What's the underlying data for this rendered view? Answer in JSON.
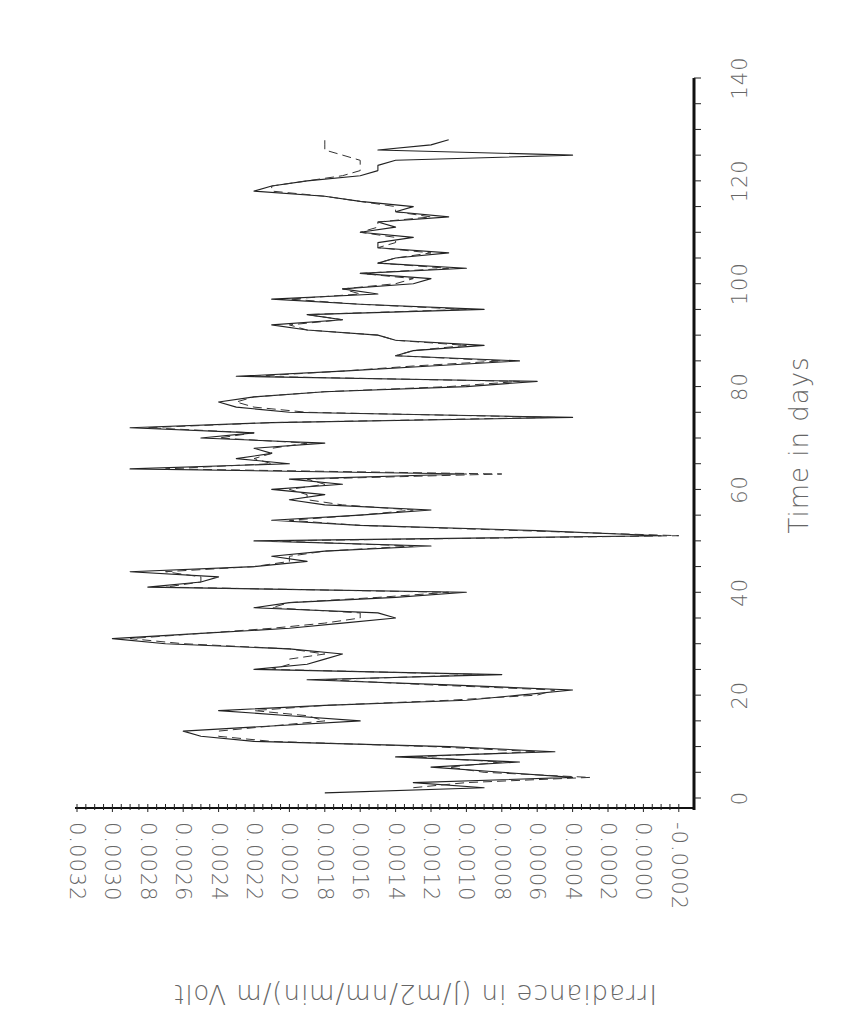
{
  "chart_data": {
    "type": "line",
    "orientation": "rotated-90-clockwise",
    "title": "",
    "xlabel": "Time in days",
    "ylabel": "Irradiance in (J/m2/nm/min)/m Volt",
    "xlim": [
      0,
      140
    ],
    "ylim": [
      -0.0002,
      0.0032
    ],
    "x_ticks": [
      "0",
      "20",
      "40",
      "60",
      "80",
      "100",
      "120",
      "140"
    ],
    "y_ticks": [
      "0.0032",
      "0.0030",
      "0.0028",
      "0.0026",
      "0.0024",
      "0.0022",
      "0.0020",
      "0.0018",
      "0.0016",
      "0.0014",
      "0.0012",
      "0.0010",
      "0.0008",
      "0.0006",
      "0.0004",
      "0.0002",
      "0.0000",
      "-0.0002"
    ],
    "grid": false,
    "legend": null,
    "series": [
      {
        "name": "measured (solid)",
        "style": "solid",
        "x": [
          1,
          2,
          3,
          4,
          5,
          6,
          7,
          8,
          9,
          10,
          11,
          12,
          13,
          14,
          15,
          16,
          17,
          18,
          19,
          20,
          21,
          22,
          23,
          24,
          25,
          26,
          27,
          28,
          29,
          30,
          31,
          32,
          33,
          34,
          35,
          36,
          37,
          38,
          39,
          40,
          41,
          42,
          43,
          44,
          45,
          46,
          47,
          48,
          49,
          50,
          51,
          52,
          53,
          54,
          55,
          56,
          57,
          58,
          59,
          60,
          61,
          62,
          63,
          64,
          65,
          66,
          67,
          68,
          69,
          70,
          71,
          72,
          73,
          74,
          75,
          76,
          77,
          78,
          79,
          80,
          81,
          82,
          83,
          84,
          85,
          86,
          87,
          88,
          89,
          90,
          91,
          92,
          93,
          94,
          95,
          96,
          97,
          98,
          99,
          100,
          101,
          102,
          103,
          104,
          105,
          106,
          107,
          108,
          109,
          110,
          111,
          112,
          113,
          114,
          115,
          116,
          117,
          118,
          119,
          120,
          121,
          122,
          123,
          124,
          125,
          126,
          127,
          128
        ],
        "values": [
          0.0018,
          0.0009,
          0.0013,
          0.0004,
          0.0008,
          0.0012,
          0.0007,
          0.0014,
          0.0005,
          0.0011,
          0.0022,
          0.0025,
          0.0026,
          0.0021,
          0.0016,
          0.002,
          0.0024,
          0.0018,
          0.001,
          0.0007,
          0.0004,
          0.0011,
          0.0019,
          0.0008,
          0.0022,
          0.0019,
          0.0018,
          0.0017,
          0.002,
          0.0027,
          0.003,
          0.0025,
          0.002,
          0.0017,
          0.0014,
          0.0015,
          0.0022,
          0.002,
          0.0014,
          0.001,
          0.0028,
          0.0025,
          0.0024,
          0.0029,
          0.0022,
          0.0019,
          0.0021,
          0.0018,
          0.0012,
          0.0022,
          -0.0001,
          0.0006,
          0.0016,
          0.0021,
          0.0016,
          0.0012,
          0.0018,
          0.002,
          0.0018,
          0.0021,
          0.0017,
          0.002,
          0.001,
          0.0029,
          0.002,
          0.0023,
          0.0021,
          0.0022,
          0.0018,
          0.0025,
          0.0022,
          0.0029,
          0.0021,
          0.0004,
          0.002,
          0.0023,
          0.0024,
          0.0022,
          0.0018,
          0.001,
          0.0006,
          0.0023,
          0.0017,
          0.0012,
          0.0007,
          0.0014,
          0.0013,
          0.0009,
          0.0014,
          0.0015,
          0.0019,
          0.0021,
          0.0017,
          0.0019,
          0.0009,
          0.0016,
          0.0021,
          0.0015,
          0.0017,
          0.0013,
          0.0012,
          0.0016,
          0.001,
          0.0015,
          0.0014,
          0.0011,
          0.0015,
          0.0015,
          0.0013,
          0.0016,
          0.0014,
          0.0015,
          0.0011,
          0.0014,
          0.0013,
          0.0016,
          0.0018,
          0.0022,
          0.0021,
          0.0019,
          0.0016,
          0.0015,
          0.0015,
          0.0014,
          0.0004,
          0.0015,
          0.0012,
          0.0011
        ]
      },
      {
        "name": "modelled (dashed)",
        "style": "dashed",
        "x": [
          2,
          3,
          4,
          5,
          6,
          7,
          8,
          9,
          10,
          11,
          12,
          13,
          14,
          15,
          16,
          17,
          18,
          19,
          20,
          21,
          22,
          23,
          24,
          25,
          26,
          27,
          28,
          29,
          30,
          31,
          32,
          33,
          34,
          35,
          36,
          37,
          38,
          39,
          40,
          41,
          42,
          43,
          44,
          45,
          46,
          47,
          48,
          49,
          50,
          51,
          52,
          53,
          54,
          55,
          56,
          57,
          58,
          59,
          60,
          61,
          62,
          63,
          64,
          65,
          66,
          67,
          68,
          69,
          70,
          71,
          72,
          73,
          74,
          75,
          76,
          77,
          78,
          79,
          80,
          81,
          82,
          83,
          84,
          85,
          86,
          87,
          88,
          89,
          90,
          91,
          92,
          93,
          94,
          95,
          96,
          97,
          98,
          99,
          100,
          101,
          102,
          103,
          104,
          105,
          106,
          107,
          108,
          109,
          110,
          111,
          112,
          113,
          114,
          115,
          116,
          117,
          118,
          119,
          120,
          121,
          122,
          123,
          124,
          125,
          126,
          127,
          128
        ],
        "values": [
          0.0013,
          0.001,
          0.0003,
          0.0009,
          0.0011,
          0.0008,
          0.0013,
          0.0006,
          0.0012,
          0.0021,
          0.0024,
          0.0024,
          0.0021,
          0.0018,
          0.0019,
          0.0022,
          0.0018,
          0.0011,
          0.0006,
          0.0005,
          0.0012,
          0.0018,
          0.0009,
          0.0021,
          0.002,
          0.002,
          0.0018,
          0.002,
          0.0026,
          0.0029,
          0.0025,
          0.0021,
          0.0018,
          0.0016,
          0.0016,
          0.0021,
          0.002,
          0.0015,
          0.0011,
          0.0027,
          0.0025,
          0.0025,
          0.0027,
          0.0022,
          0.002,
          0.002,
          0.0018,
          0.0013,
          0.0021,
          -0.0002,
          0.0007,
          0.0016,
          0.002,
          0.0016,
          0.0013,
          0.0017,
          0.0019,
          0.0019,
          0.002,
          0.0018,
          0.0019,
          0.0008,
          0.0027,
          0.0021,
          0.0022,
          0.0021,
          0.0021,
          0.0019,
          0.0024,
          0.0022,
          0.0028,
          0.0021,
          0.0005,
          0.0019,
          0.0022,
          0.0023,
          0.0022,
          0.0018,
          0.0011,
          0.0007,
          0.0022,
          0.0017,
          0.0013,
          0.0008,
          0.0014,
          0.0013,
          0.001,
          0.0014,
          0.0015,
          0.0019,
          0.002,
          0.0017,
          0.0019,
          0.001,
          0.0016,
          0.002,
          0.0016,
          0.0017,
          0.0014,
          0.0013,
          0.0016,
          0.0011,
          0.0015,
          0.0014,
          0.0012,
          0.0015,
          0.0014,
          0.0014,
          0.0016,
          0.0015,
          0.0015,
          0.0012,
          0.0014,
          0.0014,
          0.0016,
          0.0018,
          0.0021,
          0.0021,
          0.0019,
          0.0017,
          0.0016,
          0.0016,
          0.0016,
          0.0017,
          0.0018,
          0.0018,
          0.0018
        ]
      }
    ]
  }
}
